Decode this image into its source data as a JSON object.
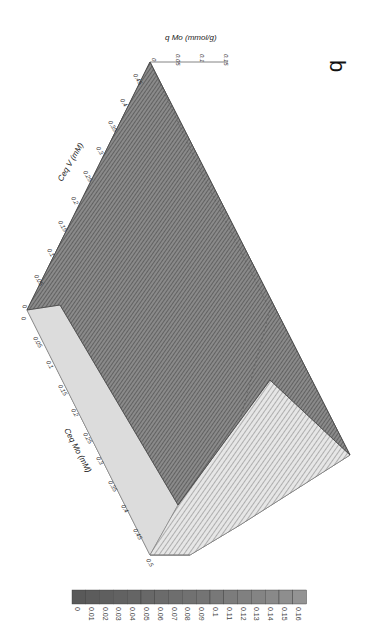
{
  "panel_label": "b",
  "chart_data": {
    "type": "surface3d",
    "orientation": "rotated 90 degrees clockwise",
    "title": "",
    "panel": "b",
    "axes": {
      "x": {
        "label": "Ceq Mo (mM)",
        "ticks": [
          "0",
          "0.05",
          "0.1",
          "0.15",
          "0.2",
          "0.25",
          "0.3",
          "0.35",
          "0.4",
          "0.45",
          "0.5"
        ],
        "range": [
          0,
          0.5
        ]
      },
      "y": {
        "label": "Ceq V (mM)",
        "ticks": [
          "0",
          "0.05",
          "0.1",
          "0.15",
          "0.2",
          "0.25",
          "0.3",
          "0.35",
          "0.4",
          "0.45"
        ],
        "range": [
          0,
          0.45
        ]
      },
      "z": {
        "label": "q Mo (mmol/g)",
        "ticks": [
          "0",
          "0.05",
          "0.1",
          "0.15"
        ],
        "range": [
          0,
          0.16
        ]
      }
    },
    "surface": {
      "description": "q Mo rises with Ceq Mo and decreases with Ceq V; contoured grayscale surface with a lighter front face",
      "z_min": 0,
      "z_max": 0.16
    },
    "legend": {
      "position": "bottom",
      "levels": [
        "0",
        "0.01",
        "0.02",
        "0.03",
        "0.04",
        "0.05",
        "0.06",
        "0.07",
        "0.08",
        "0.09",
        "0.1",
        "0.11",
        "0.12",
        "0.13",
        "0.14",
        "0.15",
        "0.16"
      ],
      "colors": [
        "#595959",
        "#5c5c5c",
        "#5f5f5f",
        "#626262",
        "#656565",
        "#686868",
        "#6b6b6b",
        "#6e6e6e",
        "#717171",
        "#747474",
        "#787878",
        "#7c7c7c",
        "#808080",
        "#848484",
        "#898989",
        "#8e8e8e",
        "#939393"
      ]
    }
  }
}
